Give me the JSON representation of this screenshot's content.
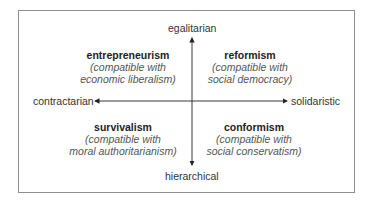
{
  "axes": {
    "top": "egalitarian",
    "bottom": "hierarchical",
    "left": "contractarian",
    "right": "solidaristic"
  },
  "quadrants": [
    {
      "position": "top-left",
      "title": "entrepreneurism",
      "line1": "(compatible with",
      "line2": "economic liberalism)"
    },
    {
      "position": "top-right",
      "title": "reformism",
      "line1": "(compatible with",
      "line2": "social democracy)"
    },
    {
      "position": "bottom-left",
      "title": "survivalism",
      "line1": "(compatible with",
      "line2": "moral authoritarianism)"
    },
    {
      "position": "bottom-right",
      "title": "conformism",
      "line1": "(compatible with",
      "line2": "social conservatism)"
    }
  ],
  "colors": {
    "border": "#8f8f8f",
    "axis": "#222222",
    "title": "#222222",
    "subtitle": "#555555"
  }
}
